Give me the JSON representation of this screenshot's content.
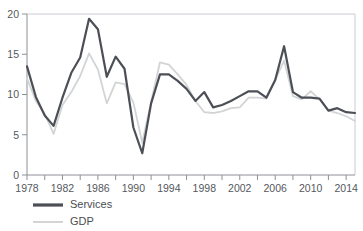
{
  "chart_data": {
    "type": "line",
    "title": "",
    "subtitle": "",
    "xlabel": "",
    "ylabel": "",
    "xlim": [
      1978,
      2015
    ],
    "ylim": [
      0,
      20
    ],
    "grid": false,
    "legend_position": "bottom-left",
    "y_ticks": [
      "0",
      "5",
      "10",
      "15",
      "20"
    ],
    "y_tick_values": [
      0,
      5,
      10,
      15,
      20
    ],
    "x_ticks": [
      "1978",
      "1982",
      "1986",
      "1990",
      "1994",
      "1998",
      "2002",
      "2006",
      "2010",
      "2014"
    ],
    "x_tick_values": [
      1978,
      1982,
      1986,
      1990,
      1994,
      1998,
      2002,
      2006,
      2010,
      2014
    ],
    "x_minor_tick_values": [
      1978,
      1980,
      1982,
      1984,
      1986,
      1988,
      1990,
      1992,
      1994,
      1996,
      1998,
      2000,
      2002,
      2004,
      2006,
      2008,
      2010,
      2012,
      2014
    ],
    "x": [
      1978,
      1979,
      1980,
      1981,
      1982,
      1983,
      1984,
      1985,
      1986,
      1987,
      1988,
      1989,
      1990,
      1991,
      1992,
      1993,
      1994,
      1995,
      1996,
      1997,
      1998,
      1999,
      2000,
      2001,
      2002,
      2003,
      2004,
      2005,
      2006,
      2007,
      2008,
      2009,
      2010,
      2011,
      2012,
      2013,
      2014,
      2015
    ],
    "series": [
      {
        "name": "Services",
        "color": "#4c4f55",
        "width": 2.2,
        "values": [
          13.5,
          9.7,
          7.4,
          6.1,
          9.6,
          12.7,
          14.6,
          19.4,
          18.1,
          12.2,
          14.7,
          13.2,
          5.9,
          2.7,
          8.9,
          12.5,
          12.5,
          11.7,
          10.7,
          9.2,
          10.3,
          8.4,
          8.7,
          9.2,
          9.8,
          10.4,
          10.4,
          9.6,
          11.8,
          16.0,
          10.3,
          9.6,
          9.6,
          9.5,
          8.0,
          8.3,
          7.8,
          7.7
        ]
      },
      {
        "name": "GDP",
        "color": "#d2d4d6",
        "width": 1.8,
        "values": [
          12.0,
          9.2,
          7.6,
          5.1,
          8.7,
          10.3,
          12.3,
          15.1,
          13.1,
          8.9,
          11.5,
          11.3,
          9.0,
          4.0,
          9.1,
          14.0,
          13.7,
          12.5,
          11.2,
          9.2,
          7.8,
          7.7,
          7.9,
          8.3,
          8.4,
          9.6,
          9.6,
          9.5,
          11.8,
          14.2,
          9.8,
          9.4,
          10.4,
          9.4,
          8.0,
          7.7,
          7.3,
          6.7
        ]
      }
    ],
    "legend": [
      {
        "label": "Services",
        "color": "#4c4f55",
        "width": 3.2
      },
      {
        "label": "GDP",
        "color": "#d2d4d6",
        "width": 2.0
      }
    ]
  }
}
